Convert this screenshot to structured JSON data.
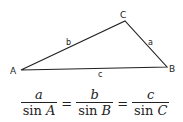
{
  "diagram": {
    "type": "triangle",
    "vertices": [
      {
        "name": "A",
        "x": 21,
        "y": 70
      },
      {
        "name": "B",
        "x": 167,
        "y": 67
      },
      {
        "name": "C",
        "x": 125,
        "y": 21
      }
    ],
    "vertex_labels": {
      "A": "A",
      "B": "B",
      "C": "C"
    },
    "side_labels": {
      "a": "a",
      "b": "b",
      "c": "c"
    },
    "line_color": "#222222"
  },
  "formula": {
    "terms": [
      {
        "numerator": "a",
        "denominator_fn": "sin",
        "denominator_var": "A"
      },
      {
        "numerator": "b",
        "denominator_fn": "sin",
        "denominator_var": "B"
      },
      {
        "numerator": "c",
        "denominator_fn": "sin",
        "denominator_var": "C"
      }
    ],
    "equals": "="
  }
}
